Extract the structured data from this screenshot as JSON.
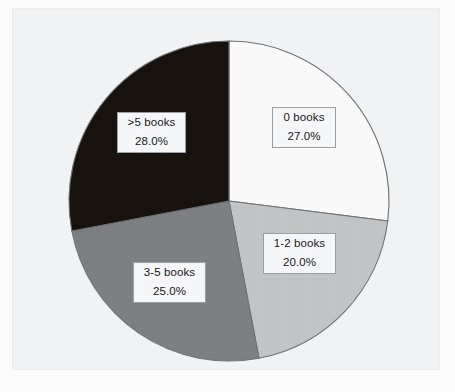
{
  "figure": {
    "background_color": "#fdfdfe",
    "panel_color": "#f2f4f6",
    "panel_border_color": "#eceef0"
  },
  "chart_data": {
    "type": "pie",
    "title": "",
    "subtitle": "",
    "xlabel": "",
    "ylabel": "",
    "grid": false,
    "legend_position": "none",
    "label_format": "category on first line, percentage on second line",
    "start_angle_deg": 90,
    "direction": "clockwise",
    "center_px": [
      229,
      201
    ],
    "radius_px": 160,
    "categories": [
      "0 books",
      "1-2 books",
      "3-5 books",
      ">5 books"
    ],
    "values": [
      27.0,
      20.0,
      25.0,
      28.0
    ],
    "value_labels": [
      "27.0%",
      "20.0%",
      "25.0%",
      "28.0%"
    ],
    "colors": [
      "#fbfbfb",
      "#c3c5c7",
      "#7e8083",
      "#191310"
    ],
    "slice_border_color": "#6e7376",
    "slices": [
      {
        "label": "0 books",
        "percent_label": "27.0%",
        "value": 27.0,
        "color": "#fbfbfb",
        "start_deg": 0.0,
        "end_deg": 97.2
      },
      {
        "label": "1-2 books",
        "percent_label": "20.0%",
        "value": 20.0,
        "color": "#c3c5c7",
        "start_deg": 97.2,
        "end_deg": 169.2
      },
      {
        "label": "3-5 books",
        "percent_label": "25.0%",
        "value": 25.0,
        "color": "#7e8083",
        "start_deg": 169.2,
        "end_deg": 259.2
      },
      {
        "label": ">5 books",
        "percent_label": "28.0%",
        "value": 28.0,
        "color": "#191310",
        "start_deg": 259.2,
        "end_deg": 360.0
      }
    ]
  },
  "labels": {
    "box_fill": "#f7f8f9",
    "box_border": "#9aa0a4",
    "text_color": "#17181a"
  }
}
